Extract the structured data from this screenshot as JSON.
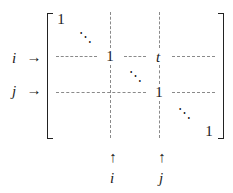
{
  "diagram": {
    "matrix_entries": {
      "top_left": "1",
      "pivot_i": "1",
      "entry_ij": "t",
      "pivot_j": "1",
      "bottom_right": "1"
    },
    "diagonal_dots": [
      "⋱",
      "⋱",
      "⋱"
    ],
    "row_labels": [
      {
        "label": "i",
        "arrow": "→"
      },
      {
        "label": "j",
        "arrow": "→"
      }
    ],
    "column_labels": [
      {
        "label": "i",
        "arrow": "↑"
      },
      {
        "label": "j",
        "arrow": "↑"
      }
    ]
  }
}
